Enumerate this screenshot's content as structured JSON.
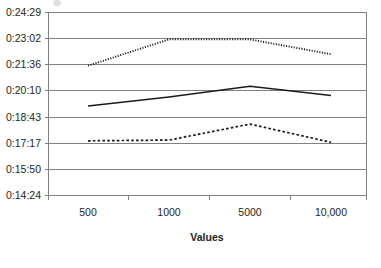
{
  "chart_data": {
    "type": "line",
    "title": "",
    "xlabel": "Values",
    "ylabel": "",
    "categories": [
      "500",
      "1000",
      "5000",
      "10,000"
    ],
    "x_tick_labels": [
      "500",
      "1000",
      "5000",
      "10,000"
    ],
    "y_tick_labels": [
      "0:14:24",
      "0:15:50",
      "0:17:17",
      "0:18:43",
      "0:20:10",
      "0:21:36",
      "0:23:02",
      "0:24:29"
    ],
    "y_tick_seconds": [
      864,
      950,
      1037,
      1123,
      1210,
      1296,
      1382,
      1469
    ],
    "ylim_labels": [
      "0:14:24",
      "0:24:29"
    ],
    "ylim_seconds": [
      864,
      1469
    ],
    "grid": true,
    "legend": "none",
    "series": [
      {
        "name": "series-dotted-upper",
        "style": "dotted",
        "color": "#1a1a1a",
        "values_labels": [
          "0:21:33",
          "0:23:00",
          "0:23:00",
          "0:22:11"
        ],
        "values_seconds": [
          1293,
          1380,
          1380,
          1331
        ]
      },
      {
        "name": "series-solid-middle",
        "style": "solid",
        "color": "#1a1a1a",
        "values_labels": [
          "0:19:20",
          "0:19:50",
          "0:20:25",
          "0:19:55"
        ],
        "values_seconds": [
          1160,
          1190,
          1225,
          1195
        ]
      },
      {
        "name": "series-dashed-lower",
        "style": "dashed",
        "color": "#1a1a1a",
        "values_labels": [
          "0:17:25",
          "0:17:27",
          "0:18:20",
          "0:17:20"
        ],
        "values_seconds": [
          1045,
          1047,
          1100,
          1040
        ]
      }
    ]
  },
  "axes": {
    "y_labels": {
      "t0": "0:24:29",
      "t1": "0:23:02",
      "t2": "0:21:36",
      "t3": "0:20:10",
      "t4": "0:18:43",
      "t5": "0:17:17",
      "t6": "0:15:50",
      "t7": "0:14:24"
    },
    "x_labels": {
      "c0": "500",
      "c1": "1000",
      "c2": "5000",
      "c3": "10,000"
    },
    "x_title": "Values"
  },
  "colors": {
    "series_stroke": "#1a1a1a",
    "gridline": "#808080",
    "plot_border": "#9a9a9a",
    "text": "#231f20",
    "background": "#ffffff"
  }
}
